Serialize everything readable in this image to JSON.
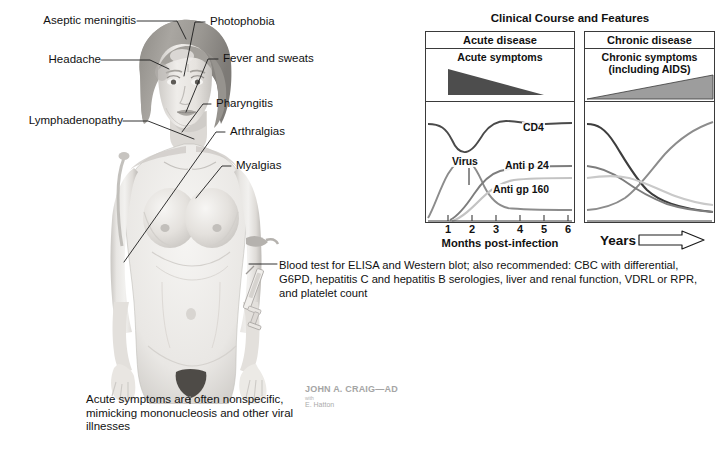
{
  "illustration": {
    "alt": "Female figure showing acute HIV infection symptoms",
    "annotations_left": [
      {
        "id": "aseptic-meningitis",
        "label": "Aseptic meningitis"
      },
      {
        "id": "headache",
        "label": "Headache"
      },
      {
        "id": "lymphadenopathy",
        "label": "Lymphadenopathy"
      }
    ],
    "annotations_right": [
      {
        "id": "photophobia",
        "label": "Photophobia"
      },
      {
        "id": "fever-and-sweats",
        "label": "Fever and sweats"
      },
      {
        "id": "pharyngitis",
        "label": "Pharyngitis"
      },
      {
        "id": "arthralgias",
        "label": "Arthralgias"
      },
      {
        "id": "myalgias",
        "label": "Myalgias"
      }
    ],
    "blood_test_note": "Blood test for ELISA and Western blot; also recommended: CBC with differential, G6PD, hepatitis C and hepatitis B serologies, liver and renal function, VDRL or RPR, and platelet count",
    "acute_caption": "Acute symptoms are often nonspecific, mimicking mononucleosis and other viral illnesses"
  },
  "signature": {
    "name": "JOHN A. CRAIG—AD",
    "with": "with",
    "assistant": "E. Hatton"
  },
  "chart_data": {
    "type": "line",
    "title": "Clinical Course and Features",
    "panels": [
      {
        "id": "acute",
        "header": "Acute disease",
        "symptom_band_label": "Acute symptoms",
        "symptom_band_shape": "triangle-decreasing",
        "xlabel": "Months post-infection",
        "xticks": [
          1,
          2,
          3,
          4,
          5,
          6
        ],
        "xlim": [
          0,
          6.4
        ],
        "ylim": [
          0,
          100
        ],
        "grid": false,
        "series": [
          {
            "name": "CD4",
            "color": "#4a4a4a",
            "x": [
              0,
              0.5,
              1.0,
              1.4,
              1.7,
              2.0,
              2.4,
              2.9,
              3.2,
              3.6,
              4.2,
              5.0,
              5.7,
              6.3
            ],
            "y": [
              82,
              81,
              74,
              63,
              60,
              66,
              76,
              83,
              84,
              82,
              81,
              82,
              81,
              81
            ]
          },
          {
            "name": "Virus",
            "color": "#8c8c8c",
            "x": [
              0,
              0.35,
              0.7,
              1.0,
              1.35,
              1.7,
              2.05,
              2.4,
              2.8,
              3.3,
              4.0,
              5.0,
              6.3
            ],
            "y": [
              2,
              14,
              32,
              42,
              45,
              42,
              32,
              20,
              11,
              7,
              5,
              5,
              5
            ]
          },
          {
            "name": "Anti p 24",
            "color": "#7d7d7d",
            "x": [
              1.05,
              1.4,
              1.75,
              2.1,
              2.5,
              2.9,
              3.4,
              4.0,
              4.8,
              5.6,
              6.3
            ],
            "y": [
              2,
              9,
              18,
              27,
              35,
              39,
              41,
              42,
              42,
              42,
              42
            ]
          },
          {
            "name": "Anti gp 160",
            "color": "#c3c3c3",
            "x": [
              1.1,
              1.5,
              1.9,
              2.3,
              2.7,
              3.1,
              3.6,
              4.2,
              5.0,
              5.8,
              6.3
            ],
            "y": [
              1,
              6,
              13,
              21,
              27,
              31,
              33,
              34,
              34,
              34,
              34
            ]
          }
        ]
      },
      {
        "id": "chronic",
        "header": "Chronic disease",
        "symptom_band_label": "Chronic symptoms\n(including AIDS)",
        "symptom_band_shape": "triangle-increasing",
        "xlabel": "Years",
        "xticks": [],
        "ylim": [
          0,
          100
        ],
        "grid": false,
        "series": [
          {
            "name": "CD4",
            "color": "#3d3d3d",
            "x": [
              0,
              0.8,
              1.6,
              2.4,
              3.2,
              4.0,
              4.8,
              5.6,
              6.4,
              7.2,
              8.0,
              8.8,
              9.6,
              10.4
            ],
            "y": [
              80,
              79,
              74,
              64,
              50,
              36,
              25,
              18,
              13,
              10,
              8,
              7,
              6,
              6
            ]
          },
          {
            "name": "Virus",
            "color": "#8c8c8c",
            "x": [
              0,
              1.0,
              2.0,
              3.0,
              4.0,
              5.0,
              6.0,
              7.0,
              8.0,
              9.0,
              10.4
            ],
            "y": [
              5,
              6,
              7,
              10,
              16,
              26,
              39,
              52,
              64,
              74,
              82
            ]
          },
          {
            "name": "Anti p 24",
            "color": "#7d7d7d",
            "x": [
              0,
              0.9,
              1.8,
              2.6,
              3.5,
              4.4,
              5.3,
              6.3,
              7.4,
              8.6,
              10.4
            ],
            "y": [
              42,
              41,
              38,
              33,
              27,
              21,
              16,
              12,
              9,
              7,
              6
            ]
          },
          {
            "name": "Anti gp 160",
            "color": "#c9c9c9",
            "x": [
              0,
              1.0,
              2.0,
              3.0,
              4.0,
              5.0,
              6.0,
              7.0,
              8.0,
              9.2,
              10.4
            ],
            "y": [
              34,
              35,
              36,
              36,
              35,
              32,
              28,
              24,
              20,
              17,
              15
            ]
          }
        ]
      }
    ],
    "curve_labels": [
      "CD4",
      "Virus",
      "Anti p 24",
      "Anti gp 160"
    ],
    "years_arrow": "⇨"
  },
  "colors": {
    "ink": "#111111",
    "frame": "#3a3a3a",
    "acute_band": "#4d4d4d",
    "chronic_band": "#9d9d9d"
  }
}
